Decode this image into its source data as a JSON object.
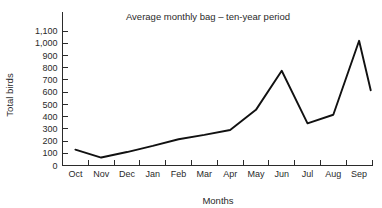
{
  "chart_data": {
    "type": "line",
    "title": "Average monthly bag – ten-year period",
    "xlabel": "Months",
    "ylabel": "Total birds",
    "categories": [
      "Oct",
      "Nov",
      "Dec",
      "Jan",
      "Feb",
      "Mar",
      "Apr",
      "May",
      "Jun",
      "Jul",
      "Aug",
      "Sep"
    ],
    "values": [
      130,
      65,
      110,
      160,
      215,
      250,
      290,
      455,
      775,
      345,
      415,
      1020
    ],
    "series": [
      {
        "name": "Total birds",
        "values": [
          130,
          65,
          110,
          160,
          215,
          250,
          290,
          455,
          775,
          345,
          415,
          1020
        ]
      }
    ],
    "trailing_point": 615,
    "ylim": [
      0,
      1100
    ],
    "ytick_values": [
      0,
      100,
      200,
      300,
      400,
      500,
      600,
      700,
      800,
      900,
      1000,
      1100
    ],
    "ytick_labels": [
      "0",
      "100",
      "200",
      "300",
      "400",
      "500",
      "600",
      "700",
      "800",
      "900",
      "1,000",
      "1,100"
    ],
    "grid": false,
    "legend": false,
    "legend_position": "none",
    "line_color": "#111111",
    "axis_color": "#2b2b2b",
    "background_color": "#ffffff"
  }
}
